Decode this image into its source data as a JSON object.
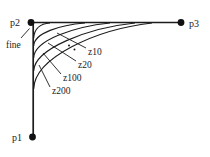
{
  "figure": {
    "background": "#ffffff",
    "ink_color": "#1c1c1c",
    "points": [
      {
        "label": "p1"
      },
      {
        "label": "p2"
      },
      {
        "label": "p3"
      }
    ],
    "curves": [
      {
        "label": "fine"
      },
      {
        "label": "z10"
      },
      {
        "label": "z20"
      },
      {
        "label": "z100"
      },
      {
        "label": "z200"
      }
    ]
  }
}
